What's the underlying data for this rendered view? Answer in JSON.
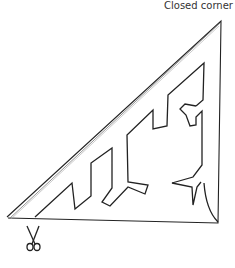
{
  "diagram": {
    "labels": {
      "corner_label": "Closed corner"
    },
    "icons": {
      "cut_start": "scissors-icon"
    },
    "colors": {
      "line": "#222222",
      "background": "#ffffff"
    }
  }
}
